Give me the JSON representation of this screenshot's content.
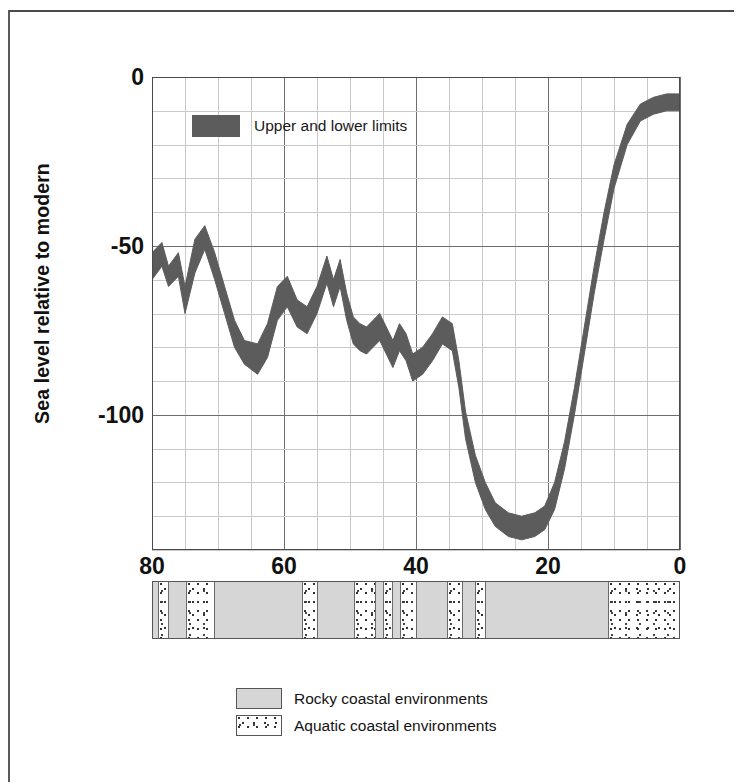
{
  "figure": {
    "series_legend": {
      "label": "Upper and lower limits",
      "swatch_color": "#5c5c5c"
    },
    "environment_legend": [
      {
        "label": "Rocky coastal environments",
        "pattern": "solid-gray",
        "color": "#d6d6d6"
      },
      {
        "label": "Aquatic coastal environments",
        "pattern": "stippled",
        "color": "#ffffff"
      }
    ]
  },
  "chart_data": {
    "type": "area",
    "title": "",
    "subtitle": "",
    "xlabel": "",
    "ylabel": "Sea level relative to modern",
    "xlim": [
      80,
      0
    ],
    "ylim": [
      -140,
      0
    ],
    "x_reversed": true,
    "grid": true,
    "legend_position": "upper-left-inside",
    "x_tick_labels": [
      "80",
      "60",
      "40",
      "20",
      "0"
    ],
    "x_tick_values": [
      80,
      60,
      40,
      20,
      0
    ],
    "x_minor_step": 5,
    "y_tick_labels": [
      "0",
      "-50",
      "-100"
    ],
    "y_tick_values": [
      0,
      -50,
      -100
    ],
    "y_minor_step": 10,
    "series": [
      {
        "name": "Upper and lower limits",
        "kind": "band",
        "color": "#5c5c5c",
        "x": [
          80,
          78.5,
          77.5,
          76,
          75,
          73.5,
          72,
          70.5,
          69,
          67.5,
          66,
          64,
          62.5,
          61,
          59.5,
          58,
          56.5,
          55,
          53.5,
          52.5,
          51.5,
          50.5,
          49.5,
          48.5,
          47.5,
          46.5,
          45.5,
          44.5,
          43.5,
          42.5,
          41.5,
          40.5,
          39,
          37.5,
          36,
          34.5,
          33.5,
          32.5,
          31,
          29.5,
          28,
          26,
          24,
          22,
          20.5,
          19,
          17.5,
          16,
          14.5,
          13,
          11.5,
          10,
          8,
          6,
          4,
          2,
          0
        ],
        "upper": [
          -52,
          -49,
          -56,
          -52,
          -62,
          -48,
          -44,
          -52,
          -62,
          -72,
          -78,
          -79,
          -73,
          -62,
          -59,
          -66,
          -68,
          -62,
          -53,
          -60,
          -54,
          -64,
          -71,
          -73,
          -74,
          -72,
          -70,
          -74,
          -78,
          -73,
          -76,
          -82,
          -80,
          -76,
          -71,
          -73,
          -84,
          -99,
          -112,
          -120,
          -126,
          -129,
          -130,
          -129,
          -127,
          -120,
          -108,
          -92,
          -74,
          -56,
          -40,
          -26,
          -14,
          -8,
          -6,
          -5,
          -5
        ],
        "lower": [
          -60,
          -56,
          -62,
          -59,
          -70,
          -58,
          -51,
          -60,
          -70,
          -80,
          -85,
          -88,
          -83,
          -72,
          -68,
          -74,
          -76,
          -70,
          -61,
          -68,
          -62,
          -72,
          -79,
          -81,
          -82,
          -80,
          -78,
          -82,
          -86,
          -81,
          -84,
          -90,
          -88,
          -84,
          -79,
          -81,
          -92,
          -107,
          -120,
          -128,
          -133,
          -136,
          -137,
          -136,
          -134,
          -128,
          -116,
          -100,
          -82,
          -64,
          -48,
          -33,
          -20,
          -13,
          -11,
          -10,
          -10
        ]
      }
    ],
    "environment_bar": {
      "x_axis": [
        80,
        0
      ],
      "segments": [
        {
          "start": 80.0,
          "end": 79.2,
          "type": "rocky"
        },
        {
          "start": 79.2,
          "end": 77.6,
          "type": "aquatic"
        },
        {
          "start": 77.6,
          "end": 75.0,
          "type": "rocky"
        },
        {
          "start": 75.0,
          "end": 70.6,
          "type": "aquatic"
        },
        {
          "start": 70.6,
          "end": 57.4,
          "type": "rocky"
        },
        {
          "start": 57.4,
          "end": 55.0,
          "type": "aquatic"
        },
        {
          "start": 55.0,
          "end": 49.6,
          "type": "rocky"
        },
        {
          "start": 49.6,
          "end": 46.2,
          "type": "aquatic"
        },
        {
          "start": 46.2,
          "end": 45.2,
          "type": "rocky"
        },
        {
          "start": 45.2,
          "end": 43.6,
          "type": "aquatic"
        },
        {
          "start": 43.6,
          "end": 42.6,
          "type": "rocky"
        },
        {
          "start": 42.6,
          "end": 40.0,
          "type": "aquatic"
        },
        {
          "start": 40.0,
          "end": 35.4,
          "type": "rocky"
        },
        {
          "start": 35.4,
          "end": 33.0,
          "type": "aquatic"
        },
        {
          "start": 33.0,
          "end": 31.2,
          "type": "rocky"
        },
        {
          "start": 31.2,
          "end": 29.6,
          "type": "aquatic"
        },
        {
          "start": 29.6,
          "end": 11.0,
          "type": "rocky"
        },
        {
          "start": 11.0,
          "end": 0.0,
          "type": "aquatic"
        }
      ]
    }
  }
}
